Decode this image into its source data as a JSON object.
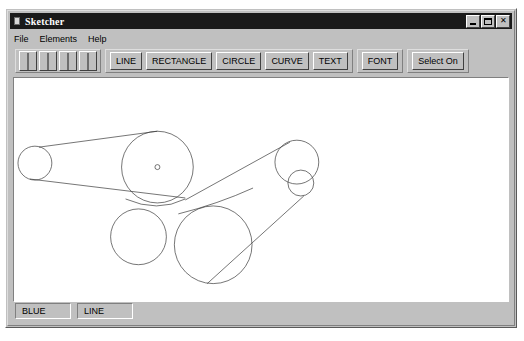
{
  "window": {
    "title": "Sketcher",
    "icon": "document-icon",
    "controls": [
      {
        "name": "minimize-button",
        "label": "_",
        "glyph": "minimize"
      },
      {
        "name": "maximize-button",
        "label": "□",
        "glyph": "maximize"
      },
      {
        "name": "close-button",
        "label": "✕",
        "glyph": "close"
      }
    ]
  },
  "menu": {
    "items": [
      {
        "label": "File"
      },
      {
        "label": "Elements"
      },
      {
        "label": "Help"
      }
    ]
  },
  "toolbar": {
    "color_swatches": [
      {
        "name": "color-swatch-black",
        "color": "#1c1c1c"
      },
      {
        "name": "color-swatch-white",
        "color": "#f2f2f2"
      },
      {
        "name": "color-swatch-gray",
        "color": "#a8a8a8"
      },
      {
        "name": "color-swatch-dark",
        "color": "#111111"
      }
    ],
    "element_buttons": [
      {
        "name": "line-button",
        "label": "LINE"
      },
      {
        "name": "rectangle-button",
        "label": "RECTANGLE"
      },
      {
        "name": "circle-button",
        "label": "CIRCLE"
      },
      {
        "name": "curve-button",
        "label": "CURVE"
      },
      {
        "name": "text-button",
        "label": "TEXT"
      }
    ],
    "font_buttons": [
      {
        "name": "font-button",
        "label": "FONT"
      }
    ],
    "select_buttons": [
      {
        "name": "select-toggle-button",
        "label": "Select On"
      }
    ]
  },
  "status_bar": {
    "panels": [
      {
        "name": "status-color",
        "label": "BLUE"
      },
      {
        "name": "status-element",
        "label": "LINE"
      }
    ]
  },
  "canvas": {
    "background": "#ffffff",
    "stroke": "#3a3a3a",
    "stroke_width": 0.7,
    "view_box": "0 0 496 223",
    "shapes": {
      "circles": [
        {
          "name": "pulley-small-left",
          "cx": 21,
          "cy": 85,
          "r": 17
        },
        {
          "name": "pulley-large-center",
          "cx": 144,
          "cy": 89,
          "r": 36
        },
        {
          "name": "pulley-bottom-left",
          "cx": 125,
          "cy": 159,
          "r": 28
        },
        {
          "name": "pulley-bottom-right",
          "cx": 200,
          "cy": 167,
          "r": 39
        },
        {
          "name": "pulley-right-large",
          "cx": 284,
          "cy": 84,
          "r": 22
        },
        {
          "name": "pulley-right-small",
          "cx": 288,
          "cy": 105,
          "r": 13
        }
      ],
      "center_marks": [
        {
          "name": "center-mark-large-center",
          "cx": 144,
          "cy": 89,
          "r": 2.5
        }
      ],
      "belts": [
        {
          "name": "belt-upper-left",
          "x1": 25,
          "y1": 69,
          "x2": 144,
          "y2": 53
        },
        {
          "name": "belt-lower-left",
          "x1": 16,
          "y1": 101,
          "x2": 172,
          "y2": 120
        },
        {
          "name": "belt-upper-right",
          "x1": 172,
          "y1": 122,
          "x2": 277,
          "y2": 64
        },
        {
          "name": "belt-lower-right",
          "x1": 194,
          "y1": 206,
          "x2": 291,
          "y2": 118
        }
      ],
      "arcs": [
        {
          "name": "belt-arc-center-bottom",
          "d": "M 112 121 Q 144 135 172 121"
        },
        {
          "name": "belt-arc-right-join",
          "d": "M 165 136 Q 205 126 240 110"
        }
      ]
    }
  }
}
